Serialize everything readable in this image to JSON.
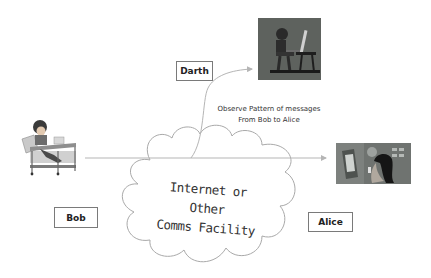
{
  "diagram": {
    "type": "passive-attack-traffic-analysis",
    "actors": {
      "sender": {
        "label": "Bob",
        "icon": "person-at-laptop-desk-icon"
      },
      "receiver": {
        "label": "Alice",
        "icon": "woman-at-computer-icon"
      },
      "attacker": {
        "label": "Darth",
        "icon": "hacker-at-computer-icon"
      }
    },
    "network": {
      "label_line1": "Internet or Other",
      "label_line2": "Comms Facility",
      "icon": "cloud-icon"
    },
    "annotation": {
      "line1": "Observe Pattern of messages",
      "line2": "From Bob to Alice"
    },
    "edges": [
      {
        "from": "Bob",
        "to": "Alice",
        "style": "straight-arrow"
      },
      {
        "from": "network",
        "to": "Darth",
        "style": "curved-arrow"
      }
    ],
    "colors": {
      "background": "#ffffff",
      "line": "#b8b8b8",
      "box_border": "#7a7a7a",
      "text": "#222222"
    }
  }
}
